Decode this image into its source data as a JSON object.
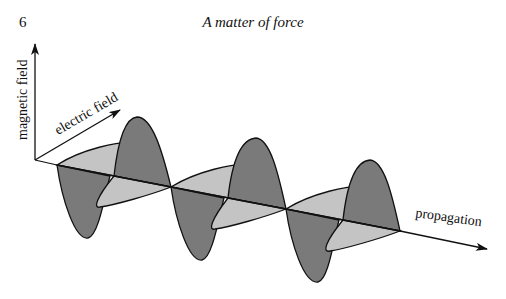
{
  "page": {
    "number": "6",
    "running_header": "A matter of force"
  },
  "figure": {
    "type": "electromagnetic wave diagram",
    "labels": {
      "magnetic_axis": "magnetic field",
      "electric_axis": "electric field",
      "propagation_axis": "propagation"
    },
    "colors": {
      "dark_lobe": "#7a7a7a",
      "light_lobe": "#c4c4c4",
      "line": "#111111"
    }
  }
}
